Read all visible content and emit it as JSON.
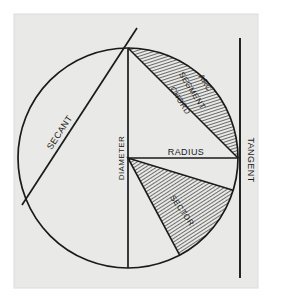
{
  "figure": {
    "kind": "geometry-diagram",
    "canvas": {
      "width": 281,
      "height": 306
    },
    "background_color": "#ffffff",
    "panel_color": "#e9e9e7",
    "panel_edge_color": "#dcdcd8",
    "ink_color": "#1a1a1a",
    "hatch_color": "#2a2a2a"
  },
  "geometry": {
    "circle": {
      "cx": 128,
      "cy": 158,
      "r": 110
    },
    "diameter_line": {
      "x": 128,
      "y1": 49,
      "y2": 268
    },
    "radius_line": {
      "x1": 128,
      "y1": 158,
      "x2": 238,
      "y2": 158
    },
    "tangent_line": {
      "x": 240,
      "y1": 38,
      "y2": 278
    },
    "secant_line": {
      "x1": 22,
      "y1": 205,
      "x2": 137,
      "y2": 28
    },
    "chord": {
      "x1": 128,
      "y1": 48,
      "x2": 238,
      "y2": 158
    },
    "sector": {
      "start_angle_deg": 62,
      "end_angle_deg": 17
    }
  },
  "labels": {
    "secant": "SECANT",
    "arc": "ARC",
    "segment": "SEGMENT",
    "chord": "CHORD",
    "diameter": "DIAMETER",
    "radius": "RADIUS",
    "tangent": "TANGENT",
    "sector": "SECTOR"
  },
  "label_styles": {
    "secant": {
      "x": 62,
      "y": 134,
      "rotate": -57,
      "size": 9
    },
    "arc": {
      "x": 203,
      "y": 84,
      "rotate": 58,
      "size": 8
    },
    "segment": {
      "x": 190,
      "y": 92,
      "rotate": 58,
      "size": 8
    },
    "chord": {
      "x": 178,
      "y": 102,
      "rotate": 58,
      "size": 8
    },
    "diameter": {
      "x": 124,
      "y": 158,
      "rotate": -90,
      "size": 8
    },
    "radius": {
      "x": 186,
      "y": 155,
      "rotate": 0,
      "size": 9
    },
    "tangent": {
      "x": 248,
      "y": 160,
      "rotate": 90,
      "size": 9
    },
    "sector": {
      "x": 180,
      "y": 212,
      "rotate": 55,
      "size": 8
    }
  }
}
